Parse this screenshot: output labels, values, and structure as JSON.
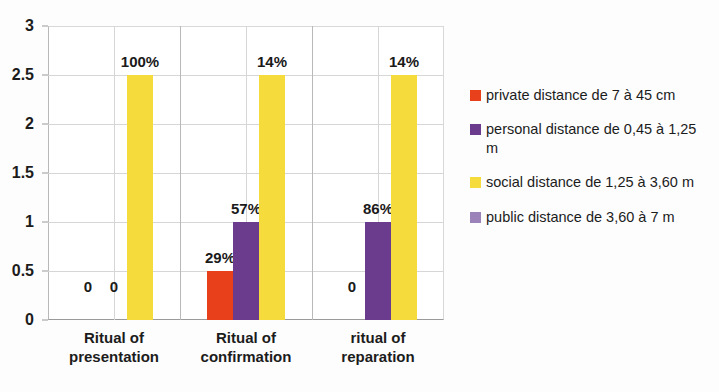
{
  "chart_data": {
    "type": "bar",
    "title": "",
    "subtitle": "",
    "xlabel": "",
    "ylabel": "",
    "grid": true,
    "legend_position": "right",
    "ylim": [
      0,
      3
    ],
    "ytick_labels": [
      "0",
      "0.5",
      "1",
      "1.5",
      "2",
      "2.5",
      "3"
    ],
    "ytick_values": [
      0,
      0.5,
      1,
      1.5,
      2,
      2.5,
      3
    ],
    "categories": [
      "Ritual of presentation",
      "Ritual of confirmation",
      "ritual of reparation"
    ],
    "category_lines": [
      [
        "Ritual of",
        "presentation"
      ],
      [
        "Ritual of",
        "confirmation"
      ],
      [
        "ritual of",
        "reparation"
      ]
    ],
    "series": [
      {
        "name": "private distance de 7 à 45 cm",
        "color": "#E8401A",
        "values": [
          0,
          0.5,
          0
        ],
        "data_labels": [
          "0",
          "29%",
          "0"
        ]
      },
      {
        "name": "personal distance de 0,45 à 1,25 m",
        "color": "#6B3B8E",
        "values": [
          0,
          1,
          1
        ],
        "data_labels": [
          "0",
          "57%",
          "86%"
        ]
      },
      {
        "name": "social distance de 1,25 à 3,60 m",
        "color": "#F5DC3C",
        "values": [
          2.5,
          2.5,
          2.5
        ],
        "data_labels": [
          "100%",
          "14%",
          "14%"
        ]
      },
      {
        "name": "public distance de 3,60 à 7 m",
        "color": "#9B82B8",
        "values": [
          0,
          0,
          0
        ],
        "data_labels": [
          "",
          "",
          ""
        ]
      }
    ]
  },
  "legend": {
    "entries": [
      {
        "label": "private distance de 7 à 45 cm",
        "color": "#E8401A"
      },
      {
        "label": "personal distance de 0,45 à 1,25 m",
        "color": "#6B3B8E"
      },
      {
        "label": "social distance de 1,25 à 3,60 m",
        "color": "#F5DC3C"
      },
      {
        "label": "public distance de 3,60 à 7 m",
        "color": "#9B82B8"
      }
    ]
  },
  "axis": {
    "y_ticks": [
      "3",
      "2.5",
      "2",
      "1.5",
      "1",
      "0.5",
      "0"
    ]
  }
}
